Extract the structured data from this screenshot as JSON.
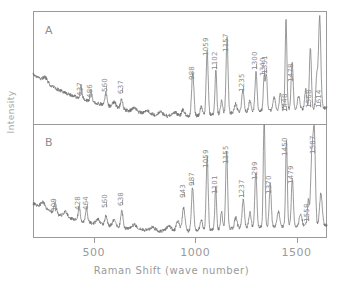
{
  "chart_data": {
    "type": "line",
    "title": "",
    "xlabel": "Raman Shift (wave number)",
    "ylabel": "Intensity",
    "xlim": [
      200,
      1650
    ],
    "xticks": [
      500,
      1000,
      1500
    ],
    "xtick_labels": [
      "500",
      "1000",
      "1500"
    ],
    "grid": false,
    "legend": null,
    "panels": [
      {
        "id": "A",
        "label": "A",
        "peaks": [
          {
            "x": 437,
            "label": "437"
          },
          {
            "x": 486,
            "label": "486"
          },
          {
            "x": 560,
            "label": "560"
          },
          {
            "x": 637,
            "label": "637"
          },
          {
            "x": 988,
            "label": "988"
          },
          {
            "x": 1059,
            "label": "1059"
          },
          {
            "x": 1102,
            "label": "1102"
          },
          {
            "x": 1157,
            "label": "1157"
          },
          {
            "x": 1235,
            "label": "1235"
          },
          {
            "x": 1300,
            "label": "1300"
          },
          {
            "x": 1340,
            "label": "1340"
          },
          {
            "x": 1351,
            "label": "1351"
          },
          {
            "x": 1448,
            "label": "1448"
          },
          {
            "x": 1478,
            "label": "1478"
          },
          {
            "x": 1568,
            "label": "1568"
          },
          {
            "x": 1614,
            "label": "1614"
          }
        ]
      },
      {
        "id": "B",
        "label": "B",
        "peaks": [
          {
            "x": 309,
            "label": "309"
          },
          {
            "x": 428,
            "label": "428"
          },
          {
            "x": 464,
            "label": "464"
          },
          {
            "x": 560,
            "label": "560"
          },
          {
            "x": 638,
            "label": "638"
          },
          {
            "x": 943,
            "label": "943"
          },
          {
            "x": 987,
            "label": "987"
          },
          {
            "x": 1059,
            "label": "1059"
          },
          {
            "x": 1101,
            "label": "1101"
          },
          {
            "x": 1155,
            "label": "1155"
          },
          {
            "x": 1237,
            "label": "1237"
          },
          {
            "x": 1299,
            "label": "1299"
          },
          {
            "x": 1370,
            "label": "1370"
          },
          {
            "x": 1450,
            "label": "1450"
          },
          {
            "x": 1479,
            "label": "1479"
          },
          {
            "x": 1558,
            "label": "1558"
          },
          {
            "x": 1587,
            "label": "1587"
          }
        ]
      }
    ],
    "colors": {
      "trace": "#6e6e6e",
      "frame": "#9a9a9a",
      "text": "#8d8d8d",
      "background": "#ffffff"
    }
  }
}
